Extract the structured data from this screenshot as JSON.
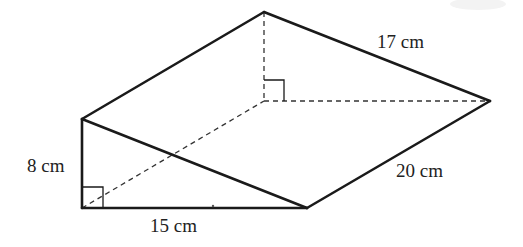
{
  "diagram": {
    "type": "triangular-prism",
    "labels": {
      "height": "8 cm",
      "base": "15 cm",
      "hypotenuse_top": "17 cm",
      "length": "20 cm"
    },
    "vertices": {
      "front_top": [
        82,
        119
      ],
      "front_bottom_left": [
        82,
        208
      ],
      "front_bottom_right": [
        307,
        208
      ],
      "back_top": [
        264,
        12
      ],
      "back_bottom_left": [
        264,
        101
      ],
      "back_bottom_right": [
        490,
        101
      ]
    },
    "colors": {
      "line": "#1a1a1a",
      "text": "#222222",
      "background": "#ffffff"
    }
  }
}
